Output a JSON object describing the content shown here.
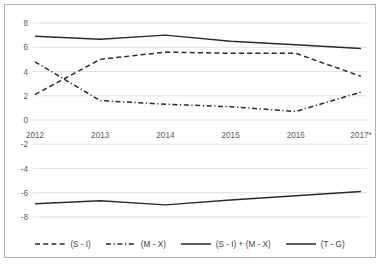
{
  "chart_data": {
    "type": "line",
    "title": "",
    "subtitle": "",
    "xlabel": "",
    "ylabel": "",
    "categories": [
      "2012",
      "2013",
      "2014",
      "2015",
      "2016",
      "2017*"
    ],
    "x": [
      2012,
      2013,
      2014,
      2015,
      2016,
      2017
    ],
    "ylim": [
      -8,
      8
    ],
    "yticks": [
      8,
      6,
      4,
      2,
      0,
      -2,
      -4,
      -6,
      -8
    ],
    "ytick_labels": [
      "8",
      "6",
      "4",
      "2",
      "0",
      "-2",
      "-4",
      "-6",
      "-8"
    ],
    "grid": true,
    "grid_axis": "y",
    "legend_position": "bottom",
    "series": [
      {
        "name": "(S - I)",
        "style": "dashed",
        "color": "#2b2b2b",
        "values": [
          2.1,
          5.0,
          5.6,
          5.5,
          5.5,
          3.6
        ]
      },
      {
        "name": "(M - X)",
        "style": "dashdot",
        "color": "#2b2b2b",
        "values": [
          4.8,
          1.6,
          1.3,
          1.1,
          0.7,
          2.3
        ]
      },
      {
        "name": "(S - I) + (M - X)",
        "style": "solid",
        "color": "#2b2b2b",
        "values": [
          6.9,
          6.65,
          7.0,
          6.5,
          6.2,
          5.9
        ]
      },
      {
        "name": "(T - G)",
        "style": "solid",
        "color": "#2b2b2b",
        "values": [
          -6.9,
          -6.65,
          -7.0,
          -6.6,
          -6.25,
          -5.9
        ]
      }
    ]
  },
  "legend": {
    "items": [
      {
        "label": "(S - I)",
        "style": "dashed"
      },
      {
        "label": "(M - X)",
        "style": "dashdot"
      },
      {
        "label": "(S - I) + (M - X)",
        "style": "solid"
      },
      {
        "label": "(T - G)",
        "style": "solid"
      }
    ]
  },
  "colors": {
    "line": "#2b2b2b",
    "grid": "#d9d9d9",
    "border": "#b0b0b0",
    "tick_text": "#59595b",
    "legend_text": "#3d3d3f",
    "background": "#ffffff"
  }
}
